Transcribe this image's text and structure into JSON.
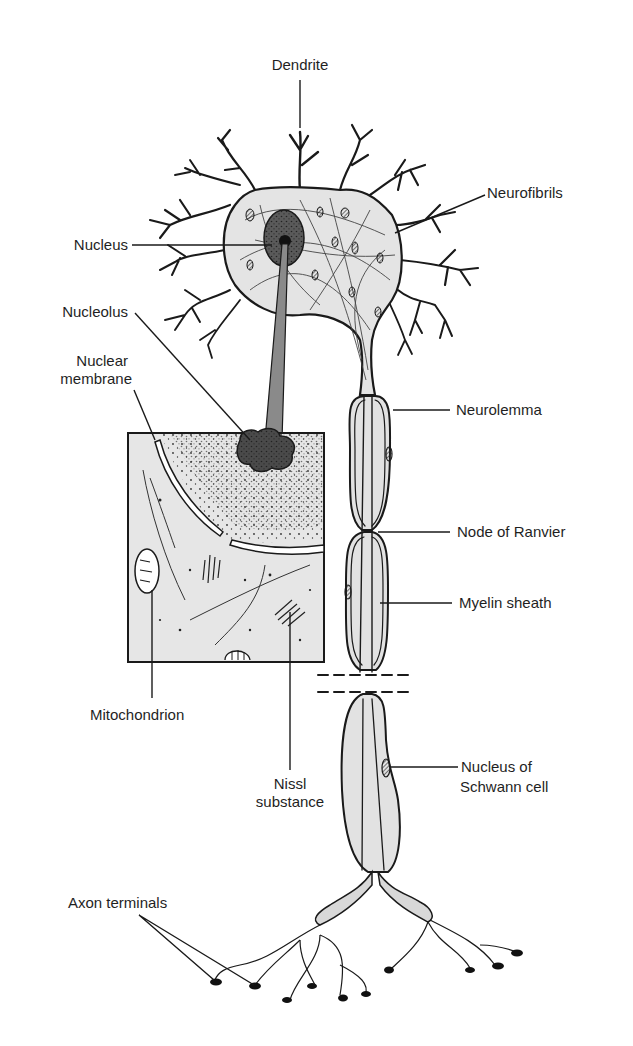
{
  "diagram": {
    "colors": {
      "line": "#1a1a1a",
      "cytoplasm": "#e4e4e4",
      "nucleus": "#5a5a5a",
      "nucleolus": "#2b2b2b",
      "zoom_beam": "#8a8a8a",
      "inset_fill": "#e6e6e6",
      "background": "#ffffff"
    },
    "labels": {
      "dendrite": "Dendrite",
      "neurofibrils": "Neurofibrils",
      "nucleus": "Nucleus",
      "nucleolus": "Nucleolus",
      "nuclear_membrane_1": "Nuclear",
      "nuclear_membrane_2": "membrane",
      "neurolemma": "Neurolemma",
      "node_of_ranvier": "Node of Ranvier",
      "myelin_sheath": "Myelin sheath",
      "mitochondrion": "Mitochondrion",
      "nissl_1": "Nissl",
      "nissl_2": "substance",
      "schwann_1": "Nucleus of",
      "schwann_2": "Schwann cell",
      "axon_terminals": "Axon terminals"
    },
    "parts": [
      "dendrite",
      "neurofibrils",
      "nucleus",
      "nucleolus",
      "nuclear-membrane",
      "neurolemma",
      "node-of-ranvier",
      "myelin-sheath",
      "mitochondrion",
      "nissl-substance",
      "nucleus-of-schwann-cell",
      "axon-terminals"
    ]
  }
}
